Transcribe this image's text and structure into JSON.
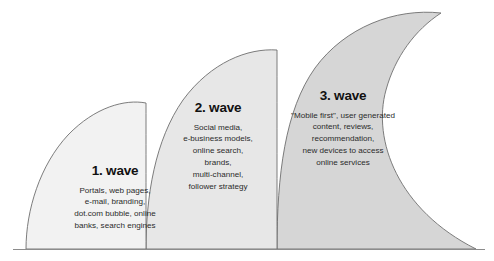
{
  "diagram": {
    "type": "wave-diagram",
    "baseline_color": "#8c8c8c",
    "outline_color": "#6e6e6e",
    "waves": [
      {
        "id": "wave-1",
        "heading": "1. wave",
        "body": "Portals, web pages,\ne-mail, branding,\ndot.com bubble, online\nbanks, search engines",
        "fill_color": "#f2f2f2"
      },
      {
        "id": "wave-2",
        "heading": "2. wave",
        "body": "Social media,\ne-business models,\nonline search,\nbrands,\nmulti-channel,\nfollower strategy",
        "fill_color": "#e7e7e7"
      },
      {
        "id": "wave-3",
        "heading": "3. wave",
        "body": "\"Mobile first\", user generated\ncontent, reviews,\nrecommendation,\nnew devices to access\nonline services",
        "fill_color": "#d6d6d6"
      }
    ]
  }
}
